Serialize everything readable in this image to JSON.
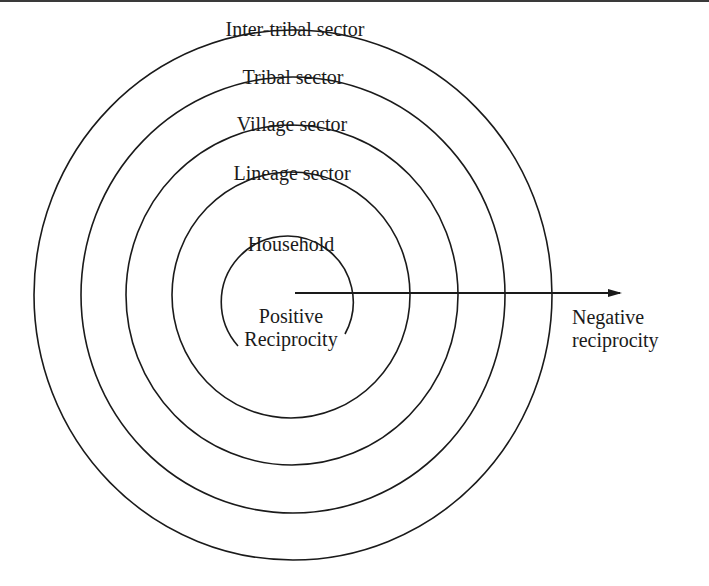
{
  "diagram": {
    "type": "concentric-sectors",
    "stroke_color": "#1a1a1a",
    "sectors": [
      {
        "label": "Inter-tribal sector",
        "ring": 1
      },
      {
        "label": "Tribal sector",
        "ring": 2
      },
      {
        "label": "Village sector",
        "ring": 3
      },
      {
        "label": "Lineage sector",
        "ring": 4
      },
      {
        "label": "Household",
        "ring": 5
      }
    ],
    "center_label": {
      "line1": "Positive",
      "line2": "Reciprocity"
    },
    "arrow_label": {
      "line1": "Negative",
      "line2": "reciprocity"
    }
  }
}
